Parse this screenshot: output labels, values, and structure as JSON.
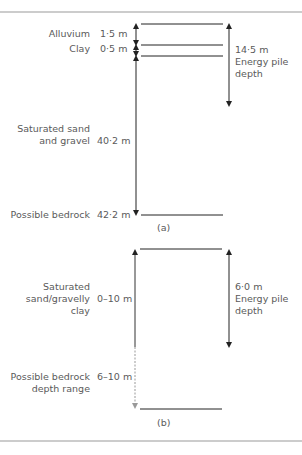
{
  "diagram_a": {
    "caption": "(a)",
    "layers": [
      {
        "name": "Alluvium",
        "thickness": "1·5 m"
      },
      {
        "name": "Clay",
        "thickness": "0·5 m"
      },
      {
        "name_line1": "Saturated sand",
        "name_line2": "and gravel",
        "thickness": "40·2 m"
      },
      {
        "name": "Possible bedrock",
        "depth": "42·2 m"
      }
    ],
    "pile": {
      "depth": "14·5 m",
      "label_line1": "Energy pile",
      "label_line2": "depth"
    }
  },
  "diagram_b": {
    "caption": "(b)",
    "layers": [
      {
        "name_line1": "Saturated",
        "name_line2": "sand/gravelly",
        "name_line3": "clay",
        "thickness": "0–10 m"
      },
      {
        "name_line1": "Possible bedrock",
        "name_line2": "depth range",
        "thickness": "6–10 m"
      }
    ],
    "pile": {
      "depth": "6·0 m",
      "label_line1": "Energy pile",
      "label_line2": "depth"
    }
  },
  "colors": {
    "line": "#222222",
    "text": "#5a5a5a",
    "separator": "#999999",
    "dashed": "#888888"
  }
}
